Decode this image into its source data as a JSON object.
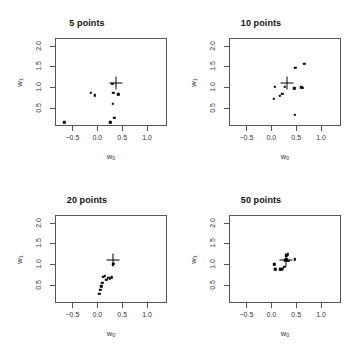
{
  "figure": {
    "layout": "2x2 grid of scatter plots",
    "background_color": "#ffffff",
    "point_color": "#000000",
    "frame_color": "#555555"
  },
  "axes": {
    "xlabel_base": "w",
    "xlabel_sub": "0",
    "ylabel_base": "w",
    "ylabel_sub": "1",
    "xlim": [
      -0.85,
      1.4
    ],
    "ylim": [
      0.08,
      2.18
    ],
    "xticks": [
      -0.5,
      0.0,
      0.5,
      1.0
    ],
    "xtick_labels": [
      "−0.5",
      "0.0",
      "0.5",
      "1.0"
    ],
    "yticks": [
      0.5,
      1.0,
      1.5,
      2.0
    ],
    "ytick_labels": [
      "0.5",
      "1.0",
      "1.5",
      "2.0"
    ],
    "grid": false
  },
  "chart_data": [
    {
      "type": "scatter",
      "title": "5 points",
      "xlabel": "w0",
      "ylabel": "w1",
      "xlim": [
        -0.85,
        1.4
      ],
      "ylim": [
        0.08,
        2.18
      ],
      "xticks": [
        -0.5,
        0.0,
        0.5,
        1.0
      ],
      "yticks": [
        0.5,
        1.0,
        1.5,
        2.0
      ],
      "grid": false,
      "series": [
        {
          "name": "posterior samples",
          "marker": "filled-square",
          "points": [
            [
              -0.66,
              0.17
            ],
            [
              -0.13,
              0.87
            ],
            [
              -0.05,
              0.81
            ],
            [
              0.26,
              0.17
            ],
            [
              0.3,
              1.08
            ],
            [
              0.32,
              0.87
            ],
            [
              0.31,
              0.61
            ],
            [
              0.34,
              0.28
            ],
            [
              0.42,
              0.84
            ]
          ]
        },
        {
          "name": "true value",
          "marker": "cross",
          "points": [
            [
              0.37,
              1.11
            ]
          ]
        }
      ]
    },
    {
      "type": "scatter",
      "title": "10 points",
      "xlabel": "w0",
      "ylabel": "w1",
      "xlim": [
        -0.85,
        1.4
      ],
      "ylim": [
        0.08,
        2.18
      ],
      "xticks": [
        -0.5,
        0.0,
        0.5,
        1.0
      ],
      "yticks": [
        0.5,
        1.0,
        1.5,
        2.0
      ],
      "grid": false,
      "series": [
        {
          "name": "posterior samples",
          "marker": "filled-square",
          "points": [
            [
              0.07,
              1.01
            ],
            [
              0.05,
              0.73
            ],
            [
              0.17,
              0.8
            ],
            [
              0.22,
              0.85
            ],
            [
              0.27,
              1.02
            ],
            [
              0.46,
              0.98
            ],
            [
              0.48,
              1.47
            ],
            [
              0.47,
              0.35
            ],
            [
              0.6,
              1.0
            ],
            [
              0.63,
              0.99
            ],
            [
              0.66,
              1.56
            ]
          ]
        },
        {
          "name": "true value",
          "marker": "cross",
          "points": [
            [
              0.31,
              1.1
            ]
          ]
        }
      ]
    },
    {
      "type": "scatter",
      "title": "20 points",
      "xlabel": "w0",
      "ylabel": "w1",
      "xlim": [
        -0.85,
        1.4
      ],
      "ylim": [
        0.08,
        2.18
      ],
      "xticks": [
        -0.5,
        0.0,
        0.5,
        1.0
      ],
      "yticks": [
        0.5,
        1.0,
        1.5,
        2.0
      ],
      "grid": false,
      "series": [
        {
          "name": "posterior samples",
          "marker": "filled-square",
          "points": [
            [
              0.04,
              0.3
            ],
            [
              0.06,
              0.4
            ],
            [
              0.08,
              0.48
            ],
            [
              0.1,
              0.56
            ],
            [
              0.12,
              0.7
            ],
            [
              0.15,
              0.73
            ],
            [
              0.18,
              0.64
            ],
            [
              0.21,
              0.68
            ],
            [
              0.25,
              0.67
            ],
            [
              0.29,
              0.69
            ],
            [
              0.31,
              1.0
            ],
            [
              0.33,
              1.02
            ]
          ]
        },
        {
          "name": "true value",
          "marker": "cross",
          "points": [
            [
              0.31,
              1.1
            ]
          ]
        }
      ]
    },
    {
      "type": "scatter",
      "title": "50 points",
      "xlabel": "w0",
      "ylabel": "w1",
      "xlim": [
        -0.85,
        1.4
      ],
      "ylim": [
        0.08,
        2.18
      ],
      "xticks": [
        -0.5,
        0.0,
        0.5,
        1.0
      ],
      "yticks": [
        0.5,
        1.0,
        1.5,
        2.0
      ],
      "grid": false,
      "series": [
        {
          "name": "posterior samples",
          "marker": "filled-square",
          "points": [
            [
              0.06,
              1.0
            ],
            [
              0.07,
              0.9
            ],
            [
              0.08,
              0.88
            ],
            [
              0.17,
              0.88
            ],
            [
              0.2,
              0.88
            ],
            [
              0.22,
              0.89
            ],
            [
              0.26,
              0.95
            ],
            [
              0.28,
              1.1
            ],
            [
              0.29,
              1.22
            ],
            [
              0.3,
              1.12
            ],
            [
              0.31,
              1.2
            ],
            [
              0.33,
              1.24
            ],
            [
              0.34,
              1.08
            ],
            [
              0.47,
              1.12
            ]
          ]
        },
        {
          "name": "true value",
          "marker": "cross",
          "points": [
            [
              0.3,
              1.1
            ]
          ]
        }
      ]
    }
  ]
}
